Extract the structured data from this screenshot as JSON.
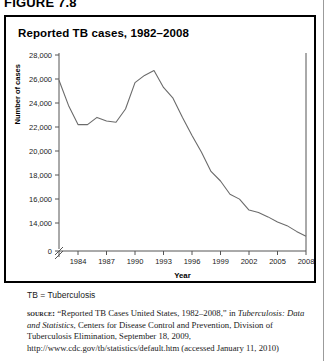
{
  "figure": {
    "label": "FIGURE 7.8"
  },
  "chart": {
    "title": "Reported TB cases, 1982–2008"
  },
  "notes": {
    "abbreviation": "TB = Tuberculosis",
    "source_kicker": "SOURCE:",
    "source_part1": "“Reported TB Cases United States, 1982–2008,” in",
    "source_italic": "Tuberculosis: Data and Statistics",
    "source_part2": ", Centers for Disease Control and Prevention, Division of Tuberculosis Elimination, September 18, 2009, http://www.cdc.gov/tb/statistics/default.htm (accessed January 11, 2010)"
  },
  "chart_data": {
    "type": "line",
    "title": "Reported TB cases, 1982–2008",
    "xlabel": "Year",
    "ylabel": "Number of cases",
    "xlim": [
      1982,
      2008
    ],
    "ylim": [
      13000,
      28000
    ],
    "y_axis_break": true,
    "y_axis_zero_label": "0",
    "grid": false,
    "legend": "none",
    "ytick_labels": [
      "0",
      "14,000",
      "16,000",
      "18,000",
      "20,000",
      "22,000",
      "24,000",
      "26,000",
      "28,000"
    ],
    "ytick_values": [
      0,
      14000,
      16000,
      18000,
      20000,
      22000,
      24000,
      26000,
      28000
    ],
    "xtick_labels": [
      "1984",
      "1987",
      "1990",
      "1993",
      "1996",
      "1999",
      "2002",
      "2005",
      "2008"
    ],
    "xtick_values": [
      1984,
      1987,
      1990,
      1993,
      1996,
      1999,
      2002,
      2005,
      2008
    ],
    "x": [
      1982,
      1983,
      1984,
      1985,
      1986,
      1987,
      1988,
      1989,
      1990,
      1991,
      1992,
      1993,
      1994,
      1995,
      1996,
      1997,
      1998,
      1999,
      2000,
      2001,
      2002,
      2003,
      2004,
      2005,
      2006,
      2007,
      2008
    ],
    "values": [
      25900,
      23800,
      22200,
      22200,
      22800,
      22500,
      22400,
      23500,
      25700,
      26300,
      26700,
      25300,
      24400,
      22800,
      21300,
      19900,
      18300,
      17500,
      16400,
      15990,
      15080,
      14870,
      14510,
      14090,
      13780,
      13300,
      12900
    ],
    "series": [
      {
        "name": "Reported TB cases",
        "values": [
          25900,
          23800,
          22200,
          22200,
          22800,
          22500,
          22400,
          23500,
          25700,
          26300,
          26700,
          25300,
          24400,
          22800,
          21300,
          19900,
          18300,
          17500,
          16400,
          15990,
          15080,
          14870,
          14510,
          14090,
          13780,
          13300,
          12900
        ]
      }
    ],
    "line_color": "#6b6b6b"
  }
}
